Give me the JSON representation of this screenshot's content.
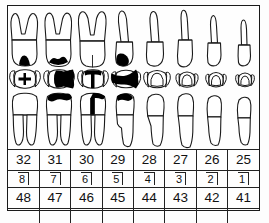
{
  "chart": {
    "quadrant_label": "lower right",
    "view_row_labels": [
      "buccal view",
      "occlusal view",
      "lingual view"
    ],
    "colors": {
      "outline": "#1a1a1a",
      "filling": "#000000",
      "background": "#fefefe",
      "grid": "#222222"
    }
  },
  "caption": "",
  "notation_rows": [
    {
      "name": "universal",
      "label": "Universal numbering",
      "cells": [
        "32",
        "31",
        "30",
        "29",
        "28",
        "27",
        "26",
        "25"
      ]
    },
    {
      "name": "palmer",
      "label": "Palmer notation",
      "cells": [
        "8",
        "7",
        "6",
        "5",
        "4",
        "3",
        "2",
        "1"
      ]
    },
    {
      "name": "fdi",
      "label": "FDI two-digit notation",
      "cells": [
        "48",
        "47",
        "46",
        "45",
        "44",
        "43",
        "42",
        "41"
      ]
    },
    {
      "name": "blank",
      "label": "notes row",
      "cells": [
        "",
        "",
        "",
        "",
        "",
        "",
        "",
        ""
      ]
    }
  ],
  "teeth": [
    {
      "universal": "32",
      "palmer": "8",
      "fdi": "48",
      "type": "third molar",
      "roots": 2,
      "buccal_filling": true,
      "occlusal_filling": "small cross",
      "lingual_filling": false
    },
    {
      "universal": "31",
      "palmer": "7",
      "fdi": "47",
      "type": "second molar",
      "roots": 2,
      "buccal_filling": true,
      "occlusal_filling": "large distal",
      "lingual_filling": true
    },
    {
      "universal": "30",
      "palmer": "6",
      "fdi": "46",
      "type": "first molar",
      "roots": 2,
      "buccal_filling": false,
      "occlusal_filling": "central T shape",
      "lingual_filling": true
    },
    {
      "universal": "29",
      "palmer": "5",
      "fdi": "45",
      "type": "second premolar",
      "roots": 1,
      "buccal_filling": true,
      "occlusal_filling": "large wedge",
      "lingual_filling": true
    },
    {
      "universal": "28",
      "palmer": "4",
      "fdi": "44",
      "type": "first premolar",
      "roots": 1,
      "buccal_filling": false,
      "occlusal_filling": "none",
      "lingual_filling": false
    },
    {
      "universal": "27",
      "palmer": "3",
      "fdi": "43",
      "type": "canine",
      "roots": 1,
      "buccal_filling": false,
      "occlusal_filling": "none",
      "lingual_filling": false
    },
    {
      "universal": "26",
      "palmer": "2",
      "fdi": "42",
      "type": "lateral incisor",
      "roots": 1,
      "buccal_filling": false,
      "occlusal_filling": "none",
      "lingual_filling": false
    },
    {
      "universal": "25",
      "palmer": "1",
      "fdi": "41",
      "type": "central incisor",
      "roots": 1,
      "buccal_filling": false,
      "occlusal_filling": "none",
      "lingual_filling": false
    }
  ]
}
